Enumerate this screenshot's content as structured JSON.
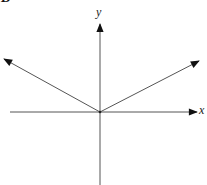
{
  "figure": {
    "panel_label": "B",
    "axes": {
      "x_label": "x",
      "y_label": "y"
    },
    "origin": [
      100,
      112
    ],
    "vectors": [
      {
        "name": "left-vector",
        "from": [
          100,
          112
        ],
        "to": [
          6,
          60
        ]
      },
      {
        "name": "right-vector",
        "from": [
          100,
          112
        ],
        "to": [
          197,
          62
        ]
      }
    ],
    "colors": {
      "line": "#555555",
      "arrowhead": "#111111"
    }
  }
}
